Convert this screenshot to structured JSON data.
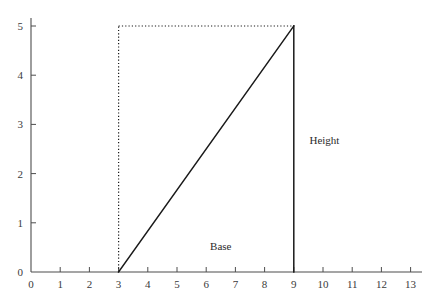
{
  "figure": {
    "background_color": "#ffffff",
    "axis_color": "#4d4d4d",
    "line_color": "#1a1a1a",
    "dotted_color": "#1a1a1a",
    "text_color": "#3a3a3a"
  },
  "chart_data": {
    "type": "line",
    "title": "",
    "subtitle": "",
    "xlabel": "",
    "ylabel": "",
    "xlim": [
      0,
      13.6
    ],
    "ylim": [
      0,
      5.3
    ],
    "grid": false,
    "legend": null,
    "x_ticks": [
      0,
      1,
      2,
      3,
      4,
      5,
      6,
      7,
      8,
      9,
      10,
      11,
      12,
      13
    ],
    "x_tick_labels": [
      "0",
      "1",
      "2",
      "3",
      "4",
      "5",
      "6",
      "7",
      "8",
      "9",
      "10",
      "11",
      "12",
      "13"
    ],
    "y_ticks": [
      0,
      1,
      2,
      3,
      4,
      5
    ],
    "y_tick_labels": [
      "0",
      "1",
      "2",
      "3",
      "4",
      "5"
    ],
    "tick_direction": "in",
    "series": [
      {
        "name": "hypotenuse",
        "style": "solid",
        "x": [
          3,
          9
        ],
        "y": [
          0,
          5
        ]
      },
      {
        "name": "height-side",
        "style": "solid",
        "x": [
          9,
          9
        ],
        "y": [
          5,
          0
        ]
      },
      {
        "name": "construction-vertical",
        "style": "dotted",
        "x": [
          3,
          3
        ],
        "y": [
          0,
          5
        ]
      },
      {
        "name": "construction-horizontal",
        "style": "dotted",
        "x": [
          3,
          9
        ],
        "y": [
          5,
          5
        ]
      }
    ],
    "annotations": [
      {
        "text": "Base",
        "x": 6.5,
        "y": 0.45
      },
      {
        "text": "Height",
        "x": 10.05,
        "y": 2.6
      }
    ]
  }
}
